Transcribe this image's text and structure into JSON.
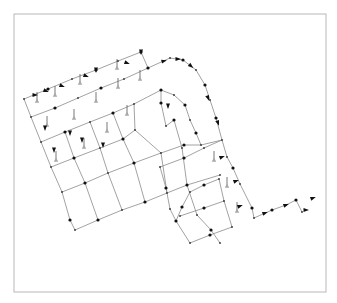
{
  "diagram": {
    "title": "",
    "type": "pipe-network",
    "frame": {
      "x": 14,
      "y": 14,
      "w": 312,
      "h": 278,
      "stroke": "#b8b8b8"
    },
    "colors": {
      "pipe": "#8a8a8a",
      "node": "#111111",
      "tank": "#a8a8a8"
    }
  },
  "chart_data": {
    "type": "network",
    "title": "",
    "legend": [],
    "polylines": [
      [
        [
          24,
          99
        ],
        [
          48,
          89
        ],
        [
          72,
          79
        ],
        [
          96,
          70
        ],
        [
          118,
          61
        ],
        [
          141,
          52
        ]
      ],
      [
        [
          31,
          117
        ],
        [
          55,
          108
        ],
        [
          78,
          98
        ],
        [
          101,
          88
        ],
        [
          124,
          79
        ],
        [
          148,
          68
        ],
        [
          170,
          58
        ],
        [
          183,
          60
        ],
        [
          196,
          70
        ],
        [
          205,
          85
        ],
        [
          210,
          100
        ],
        [
          216,
          118
        ],
        [
          222,
          140
        ]
      ],
      [
        [
          41,
          142
        ],
        [
          65,
          132
        ],
        [
          90,
          122
        ],
        [
          113,
          113
        ],
        [
          134,
          104
        ],
        [
          161,
          90
        ],
        [
          174,
          95
        ],
        [
          185,
          105
        ],
        [
          190,
          120
        ],
        [
          196,
          133
        ],
        [
          201,
          145
        ]
      ],
      [
        [
          51,
          167
        ],
        [
          74,
          158
        ],
        [
          100,
          148
        ],
        [
          123,
          139
        ],
        [
          135,
          130
        ]
      ],
      [
        [
          62,
          192
        ],
        [
          85,
          183
        ],
        [
          108,
          173
        ],
        [
          134,
          163
        ],
        [
          161,
          153
        ],
        [
          184,
          145
        ],
        [
          201,
          145
        ],
        [
          222,
          140
        ]
      ],
      [
        [
          24,
          99
        ],
        [
          31,
          117
        ],
        [
          41,
          142
        ],
        [
          51,
          167
        ],
        [
          62,
          192
        ],
        [
          70,
          220
        ],
        [
          75,
          230
        ]
      ],
      [
        [
          75,
          230
        ],
        [
          98,
          220
        ],
        [
          122,
          210
        ],
        [
          145,
          202
        ],
        [
          167,
          193
        ],
        [
          187,
          185
        ],
        [
          220,
          175
        ]
      ],
      [
        [
          141,
          52
        ],
        [
          148,
          68
        ]
      ],
      [
        [
          161,
          90
        ],
        [
          161,
          103
        ],
        [
          166,
          126
        ],
        [
          174,
          120
        ],
        [
          182,
          148
        ],
        [
          187,
          185
        ],
        [
          197,
          215
        ],
        [
          211,
          230
        ],
        [
          220,
          243
        ]
      ],
      [
        [
          160,
          167
        ],
        [
          166,
          188
        ],
        [
          170,
          209
        ],
        [
          176,
          221
        ],
        [
          190,
          243
        ],
        [
          210,
          235
        ],
        [
          232,
          227
        ]
      ],
      [
        [
          160,
          167
        ],
        [
          184,
          158
        ],
        [
          204,
          148
        ],
        [
          222,
          140
        ],
        [
          227,
          157
        ],
        [
          233,
          168
        ],
        [
          240,
          184
        ],
        [
          252,
          208
        ],
        [
          254,
          218
        ]
      ],
      [
        [
          180,
          216
        ],
        [
          204,
          208
        ],
        [
          224,
          201
        ],
        [
          232,
          227
        ]
      ],
      [
        [
          176,
          221
        ],
        [
          182,
          207
        ],
        [
          190,
          192
        ],
        [
          204,
          185
        ],
        [
          219,
          179
        ],
        [
          224,
          201
        ]
      ],
      [
        [
          254,
          218
        ],
        [
          272,
          210
        ],
        [
          286,
          205
        ],
        [
          296,
          200
        ],
        [
          302,
          212
        ]
      ],
      [
        [
          65,
          132
        ],
        [
          74,
          158
        ],
        [
          85,
          183
        ],
        [
          98,
          220
        ]
      ],
      [
        [
          90,
          122
        ],
        [
          100,
          148
        ],
        [
          108,
          173
        ],
        [
          122,
          210
        ]
      ],
      [
        [
          113,
          113
        ],
        [
          123,
          139
        ],
        [
          134,
          163
        ],
        [
          145,
          202
        ]
      ],
      [
        [
          134,
          104
        ],
        [
          135,
          130
        ],
        [
          161,
          153
        ],
        [
          167,
          193
        ]
      ]
    ],
    "tanks": [
      [
        47,
        125
      ],
      [
        56,
        160
      ],
      [
        74,
        118
      ],
      [
        84,
        147
      ],
      [
        96,
        101
      ],
      [
        107,
        131
      ],
      [
        118,
        87
      ],
      [
        127,
        114
      ],
      [
        140,
        79
      ],
      [
        37,
        101
      ],
      [
        55,
        95
      ],
      [
        80,
        83
      ],
      [
        117,
        68
      ],
      [
        214,
        160
      ],
      [
        227,
        186
      ],
      [
        237,
        211
      ]
    ],
    "arrows": [
      [
        35,
        95,
        0
      ],
      [
        46,
        91,
        20
      ],
      [
        62,
        86,
        20
      ],
      [
        86,
        76,
        20
      ],
      [
        96,
        70,
        90
      ],
      [
        127,
        63,
        20
      ],
      [
        141,
        52,
        90
      ],
      [
        164,
        61,
        -15
      ],
      [
        178,
        59,
        0
      ],
      [
        191,
        66,
        40
      ],
      [
        208,
        98,
        70
      ],
      [
        218,
        123,
        70
      ],
      [
        70,
        133,
        90
      ],
      [
        82,
        140,
        90
      ],
      [
        54,
        150,
        90
      ],
      [
        103,
        145,
        90
      ],
      [
        45,
        128,
        90
      ],
      [
        168,
        106,
        90
      ],
      [
        222,
        157,
        -20
      ],
      [
        236,
        181,
        -20
      ],
      [
        240,
        206,
        -20
      ],
      [
        265,
        213,
        -20
      ],
      [
        286,
        205,
        -20
      ],
      [
        313,
        198,
        -20
      ],
      [
        306,
        210,
        0
      ]
    ],
    "xlabel": "",
    "ylabel": ""
  }
}
